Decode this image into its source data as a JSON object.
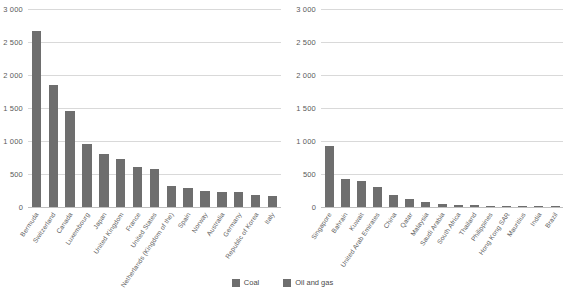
{
  "legend": {
    "items": [
      {
        "label": "Coal",
        "color": "#6e6e6e",
        "swatch_name": "coal-swatch"
      },
      {
        "label": "Oil and gas",
        "color": "#6e6e6e",
        "swatch_name": "oil-and-gas-swatch"
      }
    ]
  },
  "axis": {
    "ticks": [
      "3 000",
      "2 500",
      "2 000",
      "1 500",
      "1 000",
      "500",
      "0"
    ],
    "tick_values": [
      3000,
      2500,
      2000,
      1500,
      1000,
      500,
      0
    ],
    "ymin": 0,
    "ymax": 3000,
    "grid": true
  },
  "chart_data": [
    {
      "type": "bar",
      "title": "",
      "series_name": "Coal",
      "color": "#6e6e6e",
      "xlabel": "",
      "ylabel": "",
      "ylim": [
        0,
        3000
      ],
      "yticks": [
        0,
        500,
        1000,
        1500,
        2000,
        2500,
        3000
      ],
      "grid": true,
      "legend_position": "bottom-center",
      "categories": [
        "Bermuda",
        "Switzerland",
        "Canada",
        "Luxembourg",
        "Japan",
        "United Kingdom",
        "France",
        "United States",
        "Netherlands (Kingdom of the)",
        "Spain",
        "Norway",
        "Australia",
        "Germany",
        "Republic of Korea",
        "Italy"
      ],
      "values": [
        2670,
        1855,
        1460,
        960,
        810,
        730,
        600,
        575,
        325,
        285,
        250,
        235,
        225,
        175,
        165
      ]
    },
    {
      "type": "bar",
      "title": "",
      "series_name": "Oil and gas",
      "color": "#6e6e6e",
      "xlabel": "",
      "ylabel": "",
      "ylim": [
        0,
        3000
      ],
      "yticks": [
        0,
        500,
        1000,
        1500,
        2000,
        2500,
        3000
      ],
      "grid": true,
      "legend_position": "bottom-center",
      "categories": [
        "Singapore",
        "Bahrain",
        "Kuwait",
        "United Arab Emirates",
        "China",
        "Qatar",
        "Malaysia",
        "Saudi Arabia",
        "South Africa",
        "Thailand",
        "Philippines",
        "Hong Kong SAR",
        "Mauritius",
        "India",
        "Brazil"
      ],
      "values": [
        930,
        430,
        390,
        305,
        185,
        125,
        80,
        45,
        30,
        25,
        22,
        18,
        12,
        8,
        8
      ]
    }
  ]
}
